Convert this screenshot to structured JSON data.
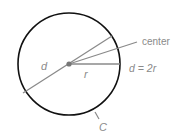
{
  "diagram": {
    "labels": {
      "center": "center",
      "diameter": "d",
      "radius": "r",
      "formula": "d = 2r",
      "circumference": "C"
    },
    "colors": {
      "circle_stroke": "#111111",
      "line_gray": "#8a8a8a",
      "center_dot": "#777777",
      "text": "#8a8a8a"
    }
  }
}
